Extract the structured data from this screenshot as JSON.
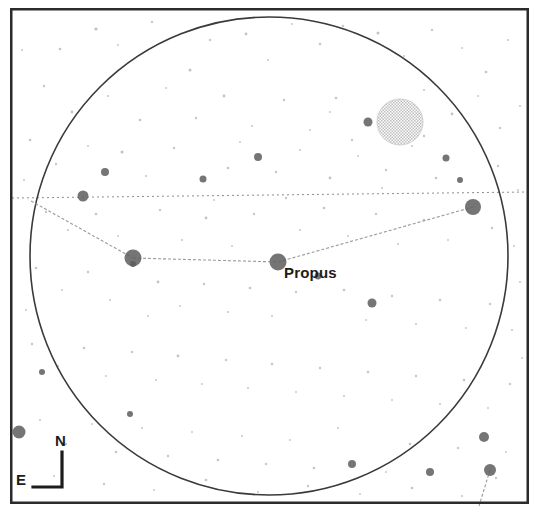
{
  "chart": {
    "type": "star-chart",
    "background_color": "#ffffff",
    "frame": {
      "x": 10,
      "y": 8,
      "width": 519,
      "height": 496,
      "stroke": "#2b2b2b",
      "stroke_width": 2.5
    },
    "field_circle": {
      "center_x": 269,
      "center_y": 256,
      "radius": 239,
      "stroke": "#3a3a3a",
      "stroke_width": 1.6,
      "label": "field of view boundary"
    },
    "ecliptic": {
      "label": "ecliptic",
      "x1": 12,
      "y1": 198,
      "x2": 528,
      "y2": 192,
      "stroke": "#8d8d8d",
      "dash": "2 3"
    },
    "constellation_lines": [
      {
        "x1": 31,
        "y1": 201,
        "x2": 133,
        "y2": 258
      },
      {
        "x1": 133,
        "y1": 258,
        "x2": 278,
        "y2": 262
      },
      {
        "x1": 278,
        "y1": 262,
        "x2": 473,
        "y2": 207
      },
      {
        "x1": 490,
        "y1": 470,
        "x2": 479,
        "y2": 506
      }
    ],
    "constellation_line_style": {
      "stroke": "#9a9a9a",
      "stroke_width": 1.1,
      "dash": "3 2"
    },
    "named_stars": [
      {
        "name": "Propus",
        "x": 278,
        "y": 262,
        "radius": 8.5,
        "label_dx": 6,
        "label_dy": 2
      }
    ],
    "bright_stars": [
      {
        "x": 133,
        "y": 258,
        "radius": 8.5
      },
      {
        "x": 473,
        "y": 207,
        "radius": 8.0
      },
      {
        "x": 19,
        "y": 432,
        "radius": 6.5
      },
      {
        "x": 490,
        "y": 470,
        "radius": 6.0
      },
      {
        "x": 484,
        "y": 437,
        "radius": 5.0
      },
      {
        "x": 83,
        "y": 196,
        "radius": 5.5
      },
      {
        "x": 372,
        "y": 303,
        "radius": 4.5
      },
      {
        "x": 368,
        "y": 122,
        "radius": 4.5
      },
      {
        "x": 430,
        "y": 472,
        "radius": 4.0
      },
      {
        "x": 352,
        "y": 464,
        "radius": 4.0
      },
      {
        "x": 258,
        "y": 157,
        "radius": 4.0
      },
      {
        "x": 105,
        "y": 172,
        "radius": 4.0
      },
      {
        "x": 203,
        "y": 179,
        "radius": 3.5
      },
      {
        "x": 446,
        "y": 158,
        "radius": 3.5
      },
      {
        "x": 133,
        "y": 264,
        "radius": 3.0
      },
      {
        "x": 460,
        "y": 180,
        "radius": 3.0
      },
      {
        "x": 318,
        "y": 276,
        "radius": 3.4
      },
      {
        "x": 130,
        "y": 414,
        "radius": 3.0
      },
      {
        "x": 42,
        "y": 372,
        "radius": 3.0
      }
    ],
    "bright_star_color": "#5d5d5d",
    "deep_sky_objects": [
      {
        "name": "open cluster",
        "center_x": 400,
        "center_y": 122,
        "radius": 23,
        "fill": "#d8d8d8",
        "style": "dithered"
      }
    ],
    "faint_stars": [
      {
        "x": 96,
        "y": 29,
        "r": 1.6
      },
      {
        "x": 152,
        "y": 22,
        "r": 1.2
      },
      {
        "x": 190,
        "y": 70,
        "r": 1.5
      },
      {
        "x": 60,
        "y": 49,
        "r": 1.3
      },
      {
        "x": 22,
        "y": 50,
        "r": 1.1
      },
      {
        "x": 118,
        "y": 45,
        "r": 1.0
      },
      {
        "x": 210,
        "y": 40,
        "r": 1.2
      },
      {
        "x": 246,
        "y": 34,
        "r": 1.4
      },
      {
        "x": 268,
        "y": 60,
        "r": 1.1
      },
      {
        "x": 292,
        "y": 24,
        "r": 1.0
      },
      {
        "x": 320,
        "y": 44,
        "r": 1.3
      },
      {
        "x": 343,
        "y": 26,
        "r": 1.2
      },
      {
        "x": 378,
        "y": 33,
        "r": 1.5
      },
      {
        "x": 404,
        "y": 56,
        "r": 1.1
      },
      {
        "x": 432,
        "y": 30,
        "r": 1.2
      },
      {
        "x": 462,
        "y": 48,
        "r": 1.0
      },
      {
        "x": 486,
        "y": 72,
        "r": 1.3
      },
      {
        "x": 508,
        "y": 40,
        "r": 1.1
      },
      {
        "x": 44,
        "y": 86,
        "r": 1.2
      },
      {
        "x": 72,
        "y": 112,
        "r": 1.4
      },
      {
        "x": 108,
        "y": 96,
        "r": 1.1
      },
      {
        "x": 140,
        "y": 120,
        "r": 1.3
      },
      {
        "x": 166,
        "y": 88,
        "r": 1.0
      },
      {
        "x": 196,
        "y": 118,
        "r": 1.2
      },
      {
        "x": 224,
        "y": 96,
        "r": 1.4
      },
      {
        "x": 252,
        "y": 126,
        "r": 1.1
      },
      {
        "x": 284,
        "y": 100,
        "r": 1.2
      },
      {
        "x": 310,
        "y": 130,
        "r": 1.0
      },
      {
        "x": 336,
        "y": 98,
        "r": 1.3
      },
      {
        "x": 352,
        "y": 140,
        "r": 1.2
      },
      {
        "x": 424,
        "y": 90,
        "r": 1.1
      },
      {
        "x": 452,
        "y": 114,
        "r": 1.4
      },
      {
        "x": 478,
        "y": 96,
        "r": 1.0
      },
      {
        "x": 500,
        "y": 128,
        "r": 1.2
      },
      {
        "x": 520,
        "y": 106,
        "r": 1.1
      },
      {
        "x": 30,
        "y": 140,
        "r": 1.3
      },
      {
        "x": 56,
        "y": 164,
        "r": 1.2
      },
      {
        "x": 88,
        "y": 146,
        "r": 1.0
      },
      {
        "x": 122,
        "y": 152,
        "r": 1.5
      },
      {
        "x": 146,
        "y": 176,
        "r": 1.1
      },
      {
        "x": 174,
        "y": 148,
        "r": 1.2
      },
      {
        "x": 228,
        "y": 168,
        "r": 1.3
      },
      {
        "x": 240,
        "y": 142,
        "r": 1.0
      },
      {
        "x": 276,
        "y": 172,
        "r": 1.2
      },
      {
        "x": 300,
        "y": 150,
        "r": 1.1
      },
      {
        "x": 330,
        "y": 178,
        "r": 1.4
      },
      {
        "x": 358,
        "y": 156,
        "r": 1.0
      },
      {
        "x": 386,
        "y": 170,
        "r": 1.2
      },
      {
        "x": 412,
        "y": 146,
        "r": 1.1
      },
      {
        "x": 436,
        "y": 178,
        "r": 1.3
      },
      {
        "x": 498,
        "y": 166,
        "r": 1.2
      },
      {
        "x": 518,
        "y": 190,
        "r": 1.0
      },
      {
        "x": 46,
        "y": 212,
        "r": 1.2
      },
      {
        "x": 68,
        "y": 230,
        "r": 1.1
      },
      {
        "x": 96,
        "y": 214,
        "r": 1.3
      },
      {
        "x": 118,
        "y": 236,
        "r": 1.0
      },
      {
        "x": 160,
        "y": 210,
        "r": 1.2
      },
      {
        "x": 182,
        "y": 240,
        "r": 1.1
      },
      {
        "x": 206,
        "y": 218,
        "r": 1.4
      },
      {
        "x": 232,
        "y": 246,
        "r": 1.0
      },
      {
        "x": 254,
        "y": 214,
        "r": 1.2
      },
      {
        "x": 300,
        "y": 230,
        "r": 1.1
      },
      {
        "x": 324,
        "y": 208,
        "r": 1.3
      },
      {
        "x": 348,
        "y": 236,
        "r": 1.0
      },
      {
        "x": 376,
        "y": 214,
        "r": 1.2
      },
      {
        "x": 398,
        "y": 244,
        "r": 1.1
      },
      {
        "x": 424,
        "y": 220,
        "r": 1.3
      },
      {
        "x": 448,
        "y": 240,
        "r": 1.0
      },
      {
        "x": 492,
        "y": 228,
        "r": 1.2
      },
      {
        "x": 514,
        "y": 246,
        "r": 1.1
      },
      {
        "x": 36,
        "y": 268,
        "r": 1.3
      },
      {
        "x": 62,
        "y": 290,
        "r": 1.0
      },
      {
        "x": 88,
        "y": 272,
        "r": 1.2
      },
      {
        "x": 110,
        "y": 300,
        "r": 1.1
      },
      {
        "x": 158,
        "y": 282,
        "r": 1.4
      },
      {
        "x": 180,
        "y": 306,
        "r": 1.0
      },
      {
        "x": 204,
        "y": 284,
        "r": 1.2
      },
      {
        "x": 228,
        "y": 312,
        "r": 1.1
      },
      {
        "x": 250,
        "y": 288,
        "r": 1.3
      },
      {
        "x": 272,
        "y": 316,
        "r": 1.0
      },
      {
        "x": 296,
        "y": 292,
        "r": 1.2
      },
      {
        "x": 344,
        "y": 290,
        "r": 1.3
      },
      {
        "x": 366,
        "y": 320,
        "r": 1.0
      },
      {
        "x": 392,
        "y": 296,
        "r": 1.2
      },
      {
        "x": 416,
        "y": 324,
        "r": 1.1
      },
      {
        "x": 440,
        "y": 300,
        "r": 1.3
      },
      {
        "x": 466,
        "y": 328,
        "r": 1.0
      },
      {
        "x": 490,
        "y": 304,
        "r": 1.2
      },
      {
        "x": 512,
        "y": 330,
        "r": 1.1
      },
      {
        "x": 32,
        "y": 344,
        "r": 1.2
      },
      {
        "x": 58,
        "y": 366,
        "r": 1.1
      },
      {
        "x": 84,
        "y": 348,
        "r": 1.3
      },
      {
        "x": 106,
        "y": 376,
        "r": 1.0
      },
      {
        "x": 132,
        "y": 352,
        "r": 1.2
      },
      {
        "x": 156,
        "y": 380,
        "r": 1.1
      },
      {
        "x": 178,
        "y": 356,
        "r": 1.4
      },
      {
        "x": 202,
        "y": 384,
        "r": 1.0
      },
      {
        "x": 226,
        "y": 360,
        "r": 1.2
      },
      {
        "x": 248,
        "y": 388,
        "r": 1.1
      },
      {
        "x": 272,
        "y": 364,
        "r": 1.3
      },
      {
        "x": 296,
        "y": 392,
        "r": 1.0
      },
      {
        "x": 320,
        "y": 368,
        "r": 1.2
      },
      {
        "x": 344,
        "y": 396,
        "r": 1.1
      },
      {
        "x": 368,
        "y": 372,
        "r": 1.3
      },
      {
        "x": 392,
        "y": 400,
        "r": 1.0
      },
      {
        "x": 416,
        "y": 376,
        "r": 1.2
      },
      {
        "x": 440,
        "y": 404,
        "r": 1.1
      },
      {
        "x": 464,
        "y": 380,
        "r": 1.3
      },
      {
        "x": 488,
        "y": 408,
        "r": 1.0
      },
      {
        "x": 510,
        "y": 384,
        "r": 1.2
      },
      {
        "x": 40,
        "y": 420,
        "r": 1.1
      },
      {
        "x": 66,
        "y": 444,
        "r": 1.2
      },
      {
        "x": 92,
        "y": 424,
        "r": 1.0
      },
      {
        "x": 116,
        "y": 452,
        "r": 1.3
      },
      {
        "x": 142,
        "y": 428,
        "r": 1.1
      },
      {
        "x": 168,
        "y": 456,
        "r": 1.2
      },
      {
        "x": 192,
        "y": 432,
        "r": 1.0
      },
      {
        "x": 218,
        "y": 460,
        "r": 1.3
      },
      {
        "x": 242,
        "y": 436,
        "r": 1.1
      },
      {
        "x": 266,
        "y": 464,
        "r": 1.2
      },
      {
        "x": 290,
        "y": 440,
        "r": 1.0
      },
      {
        "x": 314,
        "y": 468,
        "r": 1.3
      },
      {
        "x": 338,
        "y": 428,
        "r": 1.1
      },
      {
        "x": 386,
        "y": 472,
        "r": 1.0
      },
      {
        "x": 410,
        "y": 444,
        "r": 1.3
      },
      {
        "x": 458,
        "y": 448,
        "r": 1.2
      },
      {
        "x": 506,
        "y": 452,
        "r": 1.0
      },
      {
        "x": 54,
        "y": 476,
        "r": 1.1
      },
      {
        "x": 104,
        "y": 484,
        "r": 1.2
      },
      {
        "x": 154,
        "y": 490,
        "r": 1.0
      },
      {
        "x": 206,
        "y": 480,
        "r": 1.3
      },
      {
        "x": 258,
        "y": 492,
        "r": 1.1
      },
      {
        "x": 308,
        "y": 486,
        "r": 1.2
      },
      {
        "x": 360,
        "y": 494,
        "r": 1.0
      },
      {
        "x": 412,
        "y": 488,
        "r": 1.3
      },
      {
        "x": 462,
        "y": 496,
        "r": 1.1
      },
      {
        "x": 496,
        "y": 478,
        "r": 1.2
      },
      {
        "x": 26,
        "y": 310,
        "r": 1.1
      },
      {
        "x": 24,
        "y": 180,
        "r": 1.0
      },
      {
        "x": 520,
        "y": 282,
        "r": 1.1
      },
      {
        "x": 522,
        "y": 358,
        "r": 1.0
      },
      {
        "x": 148,
        "y": 316,
        "r": 1.0
      },
      {
        "x": 286,
        "y": 198,
        "r": 1.2
      },
      {
        "x": 214,
        "y": 200,
        "r": 1.0
      },
      {
        "x": 382,
        "y": 188,
        "r": 1.1
      },
      {
        "x": 330,
        "y": 112,
        "r": 1.0
      },
      {
        "x": 424,
        "y": 136,
        "r": 1.2
      }
    ],
    "faint_star_color": "#b4b4b4",
    "compass": {
      "label": "orientation indicator",
      "north_label": "N",
      "east_label": "E",
      "corner_x": 62,
      "corner_y": 487,
      "north_y": 452,
      "east_x": 33,
      "stroke": "#1c1c1c",
      "stroke_width": 3.2
    }
  }
}
